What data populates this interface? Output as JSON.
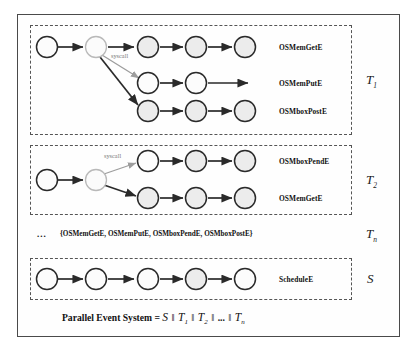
{
  "diagram": {
    "groups": [
      {
        "id": "task1",
        "symbol": "T",
        "subscript": "1",
        "syscall_label": "syscall",
        "rows": [
          {
            "label": "OSMemGetE"
          },
          {
            "label": "OSMemPutE"
          },
          {
            "label": "OSMboxPostE"
          }
        ]
      },
      {
        "id": "task2",
        "symbol": "T",
        "subscript": "2",
        "syscall_label": "syscall",
        "rows": [
          {
            "label": "OSMboxPendE"
          },
          {
            "label": "OSMemGetE"
          }
        ]
      },
      {
        "id": "taskn",
        "symbol": "T",
        "subscript": "n",
        "ellipsis": "...",
        "set_text": "{OSMemGetE, OSMemPutE, OSMboxPendE, OSMboxPostE}"
      },
      {
        "id": "scheduler",
        "symbol": "S",
        "subscript": "",
        "rows": [
          {
            "label": "ScheduleE"
          }
        ]
      }
    ],
    "formula": {
      "lhs": "Parallel  Event System",
      "equals": "=",
      "s": "S",
      "t1": "T",
      "t1sub": "1",
      "t2": "T",
      "t2sub": "2",
      "ellipsis": "...",
      "tn": "T",
      "tnsub": "n",
      "parallel_op": "‖"
    },
    "colors": {
      "node_fill": "#fcfcfc",
      "node_shaded": "#ececec",
      "node_stroke": "#2a2a2a",
      "edge": "#2a2a2a",
      "edge_faint": "#9d9d9d",
      "frame": "#4a4a4a",
      "dashed": "#555555",
      "text": "#111111"
    }
  }
}
